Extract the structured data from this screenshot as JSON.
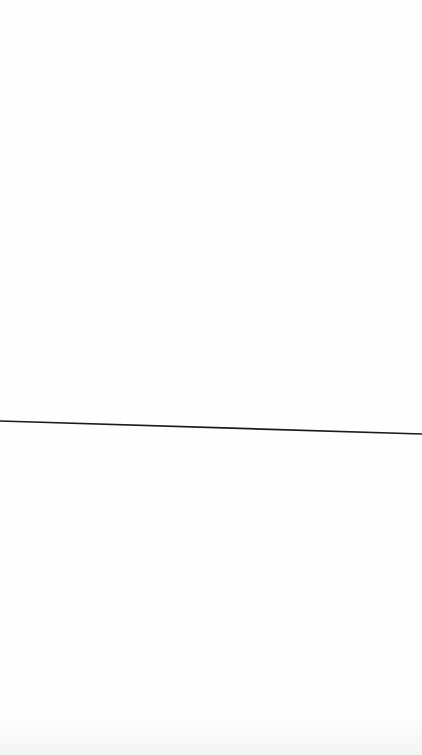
{
  "canvas": {
    "background": "#fefefe",
    "width": 422,
    "height": 755
  },
  "line": {
    "x1": 0,
    "y1": 421,
    "x2": 422,
    "y2": 434,
    "color": "#1a1a1a",
    "stroke_width": 1.6
  }
}
